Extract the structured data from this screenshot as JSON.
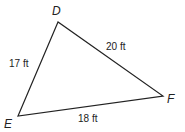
{
  "diagram": {
    "type": "triangle",
    "vertices": [
      {
        "name": "D",
        "x": 58,
        "y": 22,
        "label_x": 52,
        "label_y": 15
      },
      {
        "name": "E",
        "x": 18,
        "y": 116,
        "label_x": 4,
        "label_y": 128
      },
      {
        "name": "F",
        "x": 163,
        "y": 96,
        "label_x": 167,
        "label_y": 103
      }
    ],
    "sides": [
      {
        "name": "DE",
        "label": "17 ft",
        "x": 9,
        "y": 67
      },
      {
        "name": "DF",
        "label": "20 ft",
        "x": 106,
        "y": 50
      },
      {
        "name": "EF",
        "label": "18 ft",
        "x": 78,
        "y": 122
      }
    ],
    "colors": {
      "stroke": "#222222",
      "background": "#ffffff"
    }
  }
}
